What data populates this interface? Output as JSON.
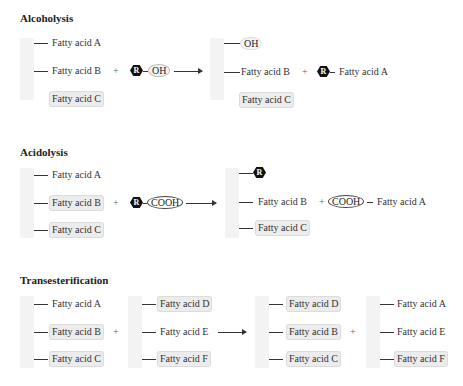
{
  "sections": [
    {
      "title": "Alcoholysis",
      "reactant_chain": [
        "Fatty acid A",
        "Fatty acid B",
        "Fatty acid C"
      ],
      "reagent": {
        "r_label": "R",
        "group": "OH"
      },
      "plus": "+",
      "product_chain": [
        "OH",
        "Fatty acid B",
        "Fatty acid C"
      ],
      "product_ester": {
        "r_label": "R",
        "fatty_acid": "Fatty acid A"
      }
    },
    {
      "title": "Acidolysis",
      "reactant_chain": [
        "Fatty acid A",
        "Fatty acid B",
        "Fatty acid C"
      ],
      "reagent": {
        "r_label": "R",
        "group": "COOH"
      },
      "plus": "+",
      "product_chain": [
        "R",
        "Fatty acid B",
        "Fatty acid C"
      ],
      "product_acid": {
        "group": "COOH",
        "fatty_acid": "Fatty acid A"
      }
    },
    {
      "title": "Transesterification",
      "reactant_chain_1": [
        "Fatty acid A",
        "Fatty acid B",
        "Fatty acid C"
      ],
      "reactant_chain_2": [
        "Fatty acid D",
        "Fatty acid E",
        "Fatty acid F"
      ],
      "plus": "+",
      "product_chain_1": [
        "Fatty acid D",
        "Fatty acid B",
        "Fatty acid C"
      ],
      "product_chain_2": [
        "Fatty acid A",
        "Fatty acid E",
        "Fatty acid F"
      ]
    }
  ]
}
